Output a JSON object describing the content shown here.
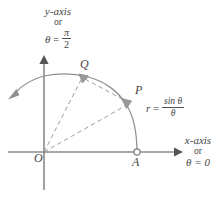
{
  "figure": {
    "background_color": "#ffffff",
    "axis_color": "#555555",
    "curve_color": "#8a8a8a",
    "dashed_color": "#9a9a9a",
    "label_color": "#444444"
  },
  "y_axis_caption": {
    "line1": "y-axis",
    "line2": "or",
    "theta_symbol": "θ",
    "equals": "=",
    "numerator": "π",
    "denominator": "2"
  },
  "x_axis_caption": {
    "line1": "x-axis",
    "line2": "or",
    "line3": "θ = 0"
  },
  "points": [
    {
      "name": "origin",
      "label": "O"
    },
    {
      "name": "point-a",
      "label": "A"
    },
    {
      "name": "point-p",
      "label": "P"
    },
    {
      "name": "point-q",
      "label": "Q"
    }
  ],
  "curve_equation": {
    "lhs": "r",
    "equals": "=",
    "numerator": "sin θ",
    "denominator": "θ"
  },
  "geometry": {
    "origin_x": 44,
    "origin_y": 152,
    "point_a_x": 137,
    "point_a_y": 152,
    "point_p_x": 128,
    "point_p_y": 103,
    "point_q_x": 83,
    "point_q_y": 77
  }
}
